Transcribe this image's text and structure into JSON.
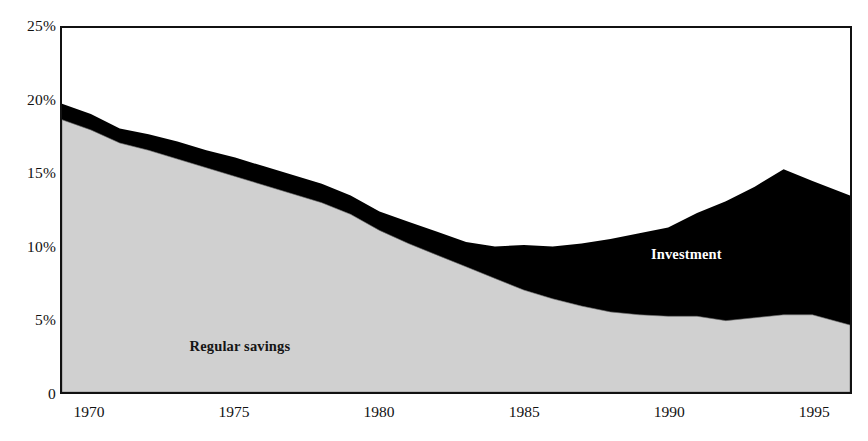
{
  "chart_data": {
    "type": "area",
    "title": "",
    "subtitle": "",
    "xlabel": "",
    "ylabel": "",
    "stacked": true,
    "grid": false,
    "legend_position": "inline-on-series",
    "xlim": [
      1969,
      1996.3
    ],
    "ylim": [
      0,
      25
    ],
    "x_tick_labels": [
      "1970",
      "1975",
      "1980",
      "1985",
      "1990",
      "1995"
    ],
    "x_ticks": [
      1970,
      1975,
      1980,
      1985,
      1990,
      1995
    ],
    "y_tick_labels": [
      "0",
      "5%",
      "10%",
      "15%",
      "20%",
      "25%"
    ],
    "y_ticks": [
      0,
      5,
      10,
      15,
      20,
      25
    ],
    "x": [
      1969,
      1970,
      1971,
      1972,
      1973,
      1974,
      1975,
      1976,
      1977,
      1978,
      1979,
      1980,
      1981,
      1982,
      1983,
      1984,
      1985,
      1986,
      1987,
      1988,
      1989,
      1990,
      1991,
      1992,
      1993,
      1994,
      1995,
      1996.3
    ],
    "series": [
      {
        "name": "Regular savings",
        "color": "#d0d0d0",
        "values": [
          18.7,
          18.0,
          17.1,
          16.6,
          16.0,
          15.4,
          14.8,
          14.2,
          13.6,
          13.0,
          12.2,
          11.1,
          10.2,
          9.4,
          8.6,
          7.8,
          7.0,
          6.4,
          5.9,
          5.5,
          5.3,
          5.2,
          5.2,
          4.9,
          5.1,
          5.3,
          5.3,
          4.6
        ]
      },
      {
        "name": "Investment",
        "color": "#000000",
        "values": [
          1.1,
          1.1,
          1.0,
          1.1,
          1.2,
          1.2,
          1.3,
          1.3,
          1.3,
          1.3,
          1.3,
          1.3,
          1.5,
          1.6,
          1.7,
          2.2,
          3.1,
          3.6,
          4.3,
          5.0,
          5.6,
          6.1,
          7.1,
          8.2,
          9.0,
          10.0,
          9.2,
          8.9
        ]
      }
    ],
    "totals": [
      19.8,
      19.1,
      18.1,
      17.7,
      17.2,
      16.6,
      16.1,
      15.5,
      14.9,
      14.3,
      13.5,
      12.4,
      11.7,
      11.0,
      10.3,
      10.0,
      10.1,
      10.0,
      10.2,
      10.5,
      10.9,
      11.3,
      12.3,
      13.1,
      14.1,
      15.3,
      14.5,
      13.5
    ],
    "annotations": [
      {
        "text": "Regular savings",
        "x": 1973.4,
        "y": 3.3,
        "color": "#151515"
      },
      {
        "text": "Investment",
        "x": 1989.3,
        "y": 9.6,
        "color": "#ffffff"
      }
    ]
  },
  "axes": {
    "y_ticks": [
      {
        "label": "25%",
        "value": 25
      },
      {
        "label": "20%",
        "value": 20
      },
      {
        "label": "15%",
        "value": 15
      },
      {
        "label": "10%",
        "value": 10
      },
      {
        "label": "5%",
        "value": 5
      },
      {
        "label": "0",
        "value": 0
      }
    ],
    "x_ticks": [
      {
        "label": "1970",
        "value": 1970
      },
      {
        "label": "1975",
        "value": 1975
      },
      {
        "label": "1980",
        "value": 1980
      },
      {
        "label": "1985",
        "value": 1985
      },
      {
        "label": "1990",
        "value": 1990
      },
      {
        "label": "1995",
        "value": 1995
      }
    ]
  },
  "labels": {
    "regular_savings": "Regular savings",
    "investment": "Investment"
  },
  "colors": {
    "regular_savings_fill": "#d0d0d0",
    "investment_fill": "#000000",
    "frame": "#111111",
    "background": "#ffffff"
  }
}
